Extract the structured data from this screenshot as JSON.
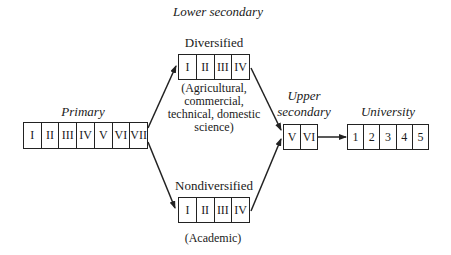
{
  "lower_secondary": {
    "title": "Lower secondary",
    "diversified": {
      "label": "Diversified",
      "cells": [
        "I",
        "II",
        "III",
        "IV"
      ],
      "note_lines": [
        "(Agricultural,",
        "commercial,",
        "technical, domestic",
        "science)"
      ]
    },
    "nondiversified": {
      "label": "Nondiversified",
      "cells": [
        "I",
        "II",
        "III",
        "IV"
      ],
      "note": "(Academic)"
    }
  },
  "primary": {
    "label": "Primary",
    "cells": [
      "I",
      "II",
      "III",
      "IV",
      "V",
      "VI",
      "VII"
    ]
  },
  "upper_secondary": {
    "label_line1": "Upper",
    "label_line2": "secondary",
    "cells": [
      "V",
      "VI"
    ]
  },
  "university": {
    "label": "University",
    "cells": [
      "1",
      "2",
      "3",
      "4",
      "5"
    ]
  },
  "colors": {
    "line": "#222222",
    "background": "#ffffff"
  }
}
